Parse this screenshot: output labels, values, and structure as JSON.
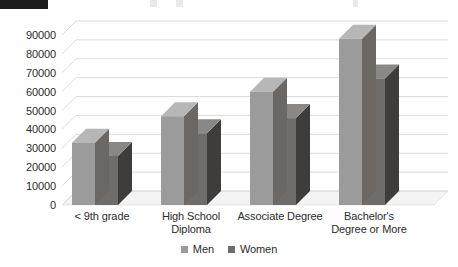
{
  "chart_data": {
    "type": "bar",
    "title": "",
    "subtitle": "",
    "xlabel": "",
    "ylabel": "",
    "categories": [
      "< 9th grade",
      "High School Diploma",
      "Associate Degree",
      "Bachelor's Degree or More"
    ],
    "category_lines": [
      [
        "< 9th grade"
      ],
      [
        "High School",
        "Diploma"
      ],
      [
        "Associate Degree"
      ],
      [
        "Bachelor's",
        "Degree or More"
      ]
    ],
    "series": [
      {
        "name": "Men",
        "values": [
          33000,
          47000,
          60000,
          88000
        ]
      },
      {
        "name": "Women",
        "values": [
          26000,
          38000,
          46000,
          67000
        ]
      }
    ],
    "ylim": [
      0,
      90000
    ],
    "ytick_step": 10000,
    "yticks": [
      90000,
      80000,
      70000,
      60000,
      50000,
      40000,
      30000,
      20000,
      10000,
      0
    ],
    "ytick_labels": [
      "90000",
      "80000",
      "70000",
      "60000",
      "50000",
      "40000",
      "30000",
      "20000",
      "10000",
      "0"
    ],
    "grid": true,
    "grid_axis": "y",
    "legend": [
      "Men",
      "Women"
    ],
    "legend_position": "bottom-center",
    "style": "3d-column",
    "colors": {
      "men_front": "#9b9b9b",
      "men_side": "#6a6764",
      "men_top": "#b7b7b7",
      "women_front": "#6f6d6b",
      "women_side": "#3f3d3b",
      "women_top": "#8a8886",
      "grid": "#d8d8d8",
      "floor": "#f3f3f3",
      "text": "#2b2b2b",
      "redaction": "#1d1d1d"
    }
  },
  "header": {
    "redaction_label": ""
  }
}
